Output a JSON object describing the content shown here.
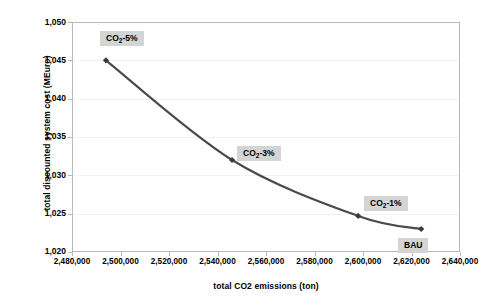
{
  "chart_data": {
    "type": "line",
    "title": "",
    "xlabel": "total CO2 emissions (ton)",
    "ylabel": "total discounted system cost (MEuro)",
    "xlim": [
      2480000,
      2640000
    ],
    "ylim": [
      1020,
      1050
    ],
    "grid": true,
    "legend": "none",
    "x_tick_labels": [
      "2,480,000",
      "2,500,000",
      "2,520,000",
      "2,540,000",
      "2,560,000",
      "2,580,000",
      "2,600,000",
      "2,620,000",
      "2,640,000"
    ],
    "x_tick_values": [
      2480000,
      2500000,
      2520000,
      2540000,
      2560000,
      2580000,
      2600000,
      2620000,
      2640000
    ],
    "y_tick_labels": [
      "1,050",
      "1,045",
      "1,040",
      "1,035",
      "1,030",
      "1,025",
      "1,020"
    ],
    "y_tick_values": [
      1050,
      1045,
      1040,
      1035,
      1030,
      1025,
      1020
    ],
    "series": [
      {
        "name": "total discounted system cost",
        "color": "#4a4a4a",
        "marker": "diamond",
        "x": [
          2494000,
          2546000,
          2598000,
          2624000
        ],
        "y": [
          1045.0,
          1032.0,
          1024.7,
          1023.0
        ]
      }
    ],
    "annotations": [
      {
        "label": "CO2-5%",
        "label_prefix": "CO",
        "label_sub": "2",
        "label_suffix": "-5%",
        "point_index": 0
      },
      {
        "label": "CO2-3%",
        "label_prefix": "CO",
        "label_sub": "2",
        "label_suffix": "-3%",
        "point_index": 1
      },
      {
        "label": "CO2-1%",
        "label_prefix": "CO",
        "label_sub": "2",
        "label_suffix": "-1%",
        "point_index": 2
      },
      {
        "label": "BAU",
        "label_prefix": "BAU",
        "label_sub": "",
        "label_suffix": "",
        "point_index": 3
      }
    ],
    "colors": {
      "line": "#4a4a4a",
      "marker": "#3b3b3b",
      "plot_border": "#b9b9b9",
      "gridline": "#f2f2f2",
      "label_background": "#d4d4d4",
      "background": "#ffffff"
    }
  },
  "axes": {
    "y_title": "total discounted system cost (MEuro)",
    "x_title": "total CO2 emissions (ton)"
  }
}
